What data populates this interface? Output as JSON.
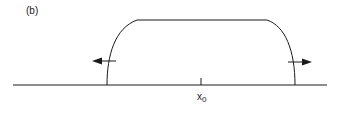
{
  "figure": {
    "panel_label": "(b)",
    "axis_label": "x",
    "axis_label_subscript": "0",
    "colors": {
      "stroke": "#1a1a1a",
      "background": "#ffffff"
    }
  }
}
